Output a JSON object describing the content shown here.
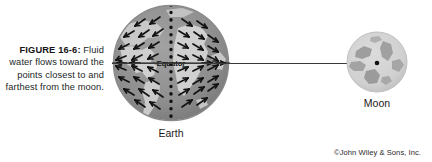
{
  "figure": {
    "caption_label": "FIGURE 16-6:",
    "caption_text": "Fluid water flows toward the points closest to and farthest from the moon.",
    "credit": "©John Wiley & Sons, Inc."
  },
  "earth": {
    "label": "Earth",
    "equator_label": "Equator",
    "ocean_color": "#8e8e8e",
    "land_color": "#c8c8c8",
    "outline_color": "#9a9a9a",
    "arrow_color": "#1a1a1a",
    "meridian_color": "#111111",
    "meridian_style": "dotted",
    "arrow_meaning": "tidal water flow converging toward near and far points"
  },
  "moon": {
    "label": "Moon",
    "surface_color": "#d2d2d2",
    "maria_color": "#9b9b9b",
    "center_dot_color": "#111111"
  },
  "connector": {
    "color": "#3a3a3a",
    "description": "line from Earth equator to Moon center"
  }
}
